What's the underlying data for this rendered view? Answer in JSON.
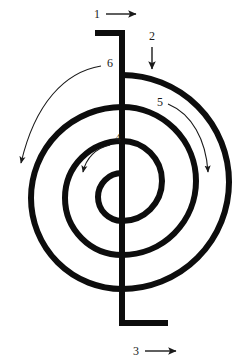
{
  "figure": {
    "type": "line-diagram",
    "background_color": "#ffffff",
    "stroke_color": "#0d0d0d",
    "annotation_color": "#1a1a1a",
    "coil_stroke_width": 6,
    "turns": 3,
    "center": {
      "x": 122,
      "y": 182
    },
    "center_line_crossings_upper": [
      75,
      108,
      143
    ],
    "center_line_crossings_lower": [
      222,
      257,
      290
    ],
    "horizontal_crossings_left": [
      31,
      66,
      97
    ],
    "horizontal_crossings_right": [
      150,
      183,
      214
    ]
  },
  "labels": {
    "top_lead": {
      "text": "1",
      "arrow": "straight-right-arrow",
      "direction": "right",
      "x": 97,
      "y": 18
    },
    "entry_segment": {
      "text": "2",
      "arrow": "straight-down-arrow",
      "direction": "down",
      "x": 152,
      "y": 37
    },
    "bottom_lead": {
      "text": "3",
      "arrow": "straight-right-arrow",
      "direction": "right",
      "x": 136,
      "y": 351
    },
    "inner_turn": {
      "text": "4",
      "arrow": "curved-arrow",
      "direction": "counterclockwise",
      "x": 117,
      "y": 138
    },
    "middle_turn": {
      "text": "5",
      "arrow": "curved-arrow",
      "direction": "clockwise",
      "x": 160,
      "y": 102
    },
    "outer_turn": {
      "text": "6",
      "arrow": "curved-arrow",
      "direction": "counterclockwise",
      "x": 108,
      "y": 63
    }
  },
  "leads": {
    "top": {
      "name": "top-lead",
      "horizontal_start_x": 95,
      "horizontal_y": 33,
      "corner_x": 122
    },
    "bottom": {
      "name": "bottom-lead",
      "vertical_end_y": 323,
      "horizontal_end_x": 168
    }
  }
}
